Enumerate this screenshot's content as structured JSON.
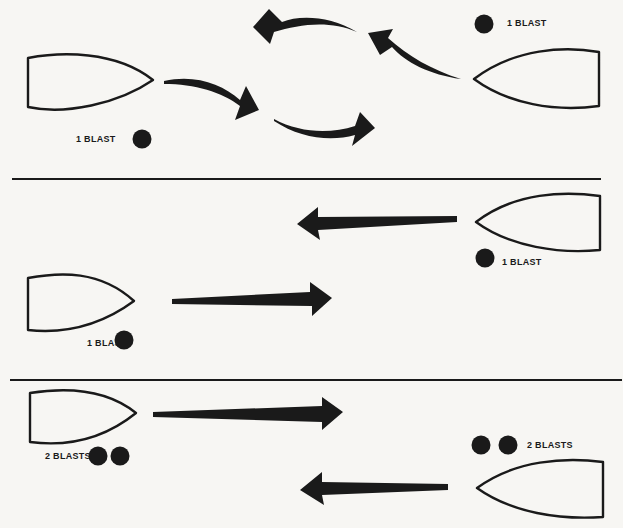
{
  "diagram": {
    "type": "navigation-sound-signals",
    "colors": {
      "background": "#f7f6f3",
      "ink": "#1a1a1a"
    },
    "panels": [
      {
        "id": "panel-1-meeting-curved",
        "labels": {
          "left_vessel_signal": "1 BLAST",
          "right_vessel_signal": "1 BLAST"
        },
        "left_vessel": {
          "heading": "right",
          "blasts": 1
        },
        "right_vessel": {
          "heading": "left",
          "blasts": 1
        },
        "arrows": [
          "curved-right-then-down",
          "curved-right",
          "curved-left-up",
          "curved-left"
        ]
      },
      {
        "id": "panel-2-passing-straight",
        "labels": {
          "right_vessel_signal": "1 BLAST",
          "left_vessel_signal": "1 BLAST"
        },
        "right_vessel": {
          "heading": "left",
          "blasts": 1
        },
        "left_vessel": {
          "heading": "right",
          "blasts": 1
        }
      },
      {
        "id": "panel-3-passing-straight",
        "labels": {
          "left_vessel_signal": "2 BLASTS",
          "right_vessel_signal": "2 BLASTS"
        },
        "left_vessel": {
          "heading": "right",
          "blasts": 2
        },
        "right_vessel": {
          "heading": "left",
          "blasts": 2
        }
      }
    ]
  }
}
